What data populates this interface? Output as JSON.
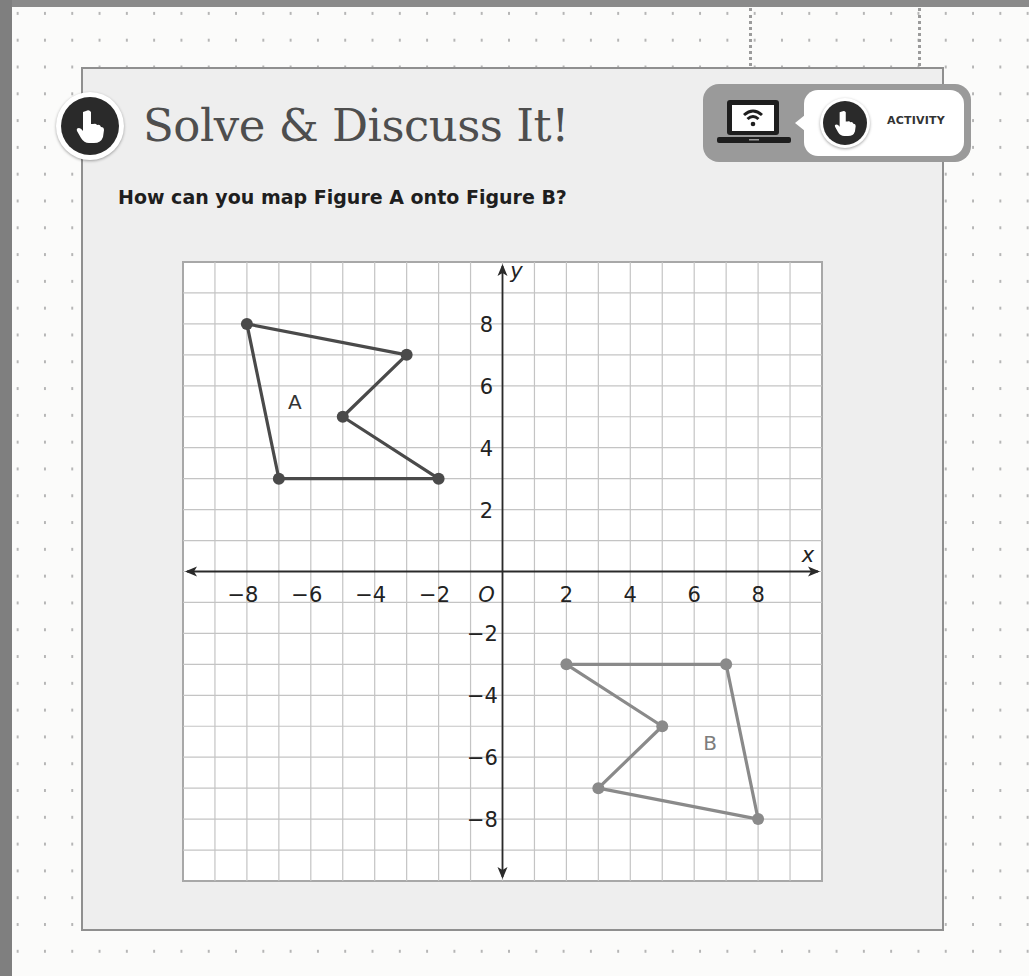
{
  "header": {
    "title": "Solve & Discuss It!",
    "prompt": "How can you map Figure A onto Figure B?",
    "activity_badge": {
      "label": "ACTIVITY",
      "icons": [
        "laptop-wifi-icon",
        "hand-pointer-icon"
      ]
    }
  },
  "colors": {
    "figure_a": "#4a4a4a",
    "figure_b": "#8a8a8a",
    "grid_line": "#c4c4c4",
    "axis": "#2a2a2a",
    "panel_bg": "#eeeeee"
  },
  "chart_data": {
    "type": "scatter",
    "title": "",
    "xlabel": "x",
    "ylabel": "y",
    "origin_label": "O",
    "xlim": [
      -10,
      10
    ],
    "ylim": [
      -10,
      10
    ],
    "grid": true,
    "x_ticks": [
      -8,
      -6,
      -4,
      -2,
      2,
      4,
      6,
      8
    ],
    "y_ticks": [
      8,
      6,
      4,
      2,
      -2,
      -4,
      -6,
      -8
    ],
    "series": [
      {
        "name": "A",
        "closed": true,
        "points": [
          [
            -8,
            8
          ],
          [
            -3,
            7
          ],
          [
            -5,
            5
          ],
          [
            -2,
            3
          ],
          [
            -7,
            3
          ]
        ],
        "label_position": [
          -6.5,
          5.5
        ]
      },
      {
        "name": "B",
        "closed": true,
        "points": [
          [
            2,
            -3
          ],
          [
            7,
            -3
          ],
          [
            8,
            -8
          ],
          [
            3,
            -7
          ],
          [
            5,
            -5
          ]
        ],
        "label_position": [
          6.5,
          -5.5
        ]
      }
    ]
  }
}
